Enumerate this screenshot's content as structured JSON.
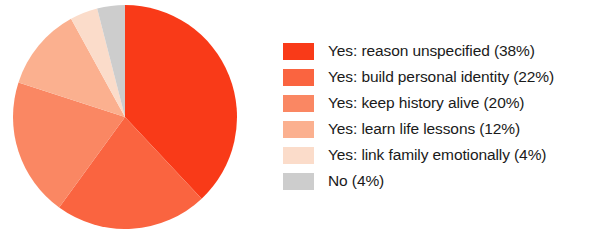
{
  "chart_data": {
    "type": "pie",
    "title": "",
    "subtitle": "",
    "xlabel": "",
    "ylabel": "",
    "grid": false,
    "legend_position": "right",
    "start_angle_deg": 90,
    "direction": "clockwise",
    "units": "percent",
    "total": 100,
    "categories": [
      "Yes: reason unspecified",
      "Yes: build personal identity",
      "Yes: keep history alive",
      "Yes: learn life lessons",
      "Yes: link family emotionally",
      "No"
    ],
    "values": [
      38,
      22,
      20,
      12,
      4,
      4
    ],
    "colors": [
      "#f93a18",
      "#fa6440",
      "#fa8763",
      "#fbb08f",
      "#fbdcca",
      "#cdcdcd"
    ],
    "slices": [
      {
        "label": "Yes: reason unspecified",
        "legend_text": "Yes: reason unspecified (38%)",
        "value": 38,
        "color": "#f93a18"
      },
      {
        "label": "Yes: build personal identity",
        "legend_text": "Yes: build personal identity (22%)",
        "value": 22,
        "color": "#fa6440"
      },
      {
        "label": "Yes: keep history alive",
        "legend_text": "Yes: keep history alive (20%)",
        "value": 20,
        "color": "#fa8763"
      },
      {
        "label": "Yes: learn life lessons",
        "legend_text": "Yes: learn life lessons (12%)",
        "value": 12,
        "color": "#fbb08f"
      },
      {
        "label": "Yes: link family emotionally",
        "legend_text": "Yes: link family emotionally (4%)",
        "value": 4,
        "color": "#fbdcca"
      },
      {
        "label": "No",
        "legend_text": "No (4%)",
        "value": 4,
        "color": "#cdcdcd"
      }
    ]
  },
  "legend": {
    "items": [
      {
        "text": "Yes: reason unspecified (38%)",
        "color": "#f93a18"
      },
      {
        "text": "Yes: build personal identity (22%)",
        "color": "#fa6440"
      },
      {
        "text": "Yes: keep history alive (20%)",
        "color": "#fa8763"
      },
      {
        "text": "Yes: learn life lessons (12%)",
        "color": "#fbb08f"
      },
      {
        "text": "Yes: link family emotionally (4%)",
        "color": "#fbdcca"
      },
      {
        "text": "No (4%)",
        "color": "#cdcdcd"
      }
    ]
  }
}
